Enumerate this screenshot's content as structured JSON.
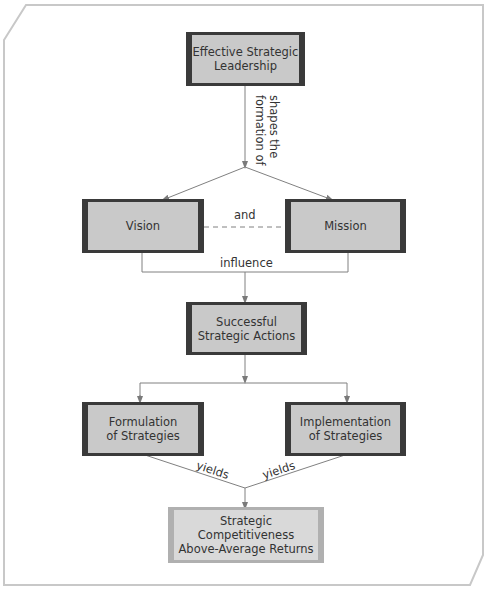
{
  "diagram": {
    "nodes": {
      "leadership": "Effective Strategic Leadership",
      "leadership_line1": "Effective Strategic",
      "leadership_line2": "Leadership",
      "vision": "Vision",
      "mission": "Mission",
      "actions_line1": "Successful",
      "actions_line2": "Strategic Actions",
      "formulation_line1": "Formulation",
      "formulation_line2": "of Strategies",
      "implementation_line1": "Implementation",
      "implementation_line2": "of Strategies",
      "outcome_line1": "Strategic",
      "outcome_line2": "Competitiveness",
      "outcome_line3": "Above-Average Returns"
    },
    "edges": {
      "shapes_line1": "shapes the",
      "shapes_line2": "formation of",
      "and": "and",
      "influence": "influence",
      "yields_left": "yields",
      "yields_right": "yields"
    },
    "colors": {
      "box_fill": "#c9c9c9",
      "box_border": "#3a3a3a",
      "outcome_fill": "#d9d9d9",
      "outcome_border": "#b0b0b0",
      "connector": "#808080",
      "frame": "#c8c8c8"
    }
  }
}
